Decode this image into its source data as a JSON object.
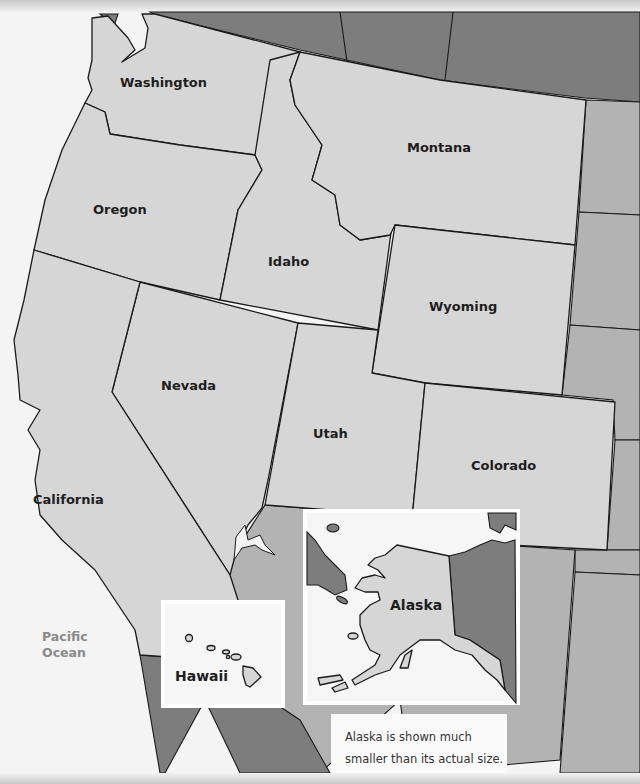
{
  "map": {
    "title": "Western United States",
    "states": [
      {
        "id": "washington",
        "label": "Washington"
      },
      {
        "id": "oregon",
        "label": "Oregon"
      },
      {
        "id": "california",
        "label": "California"
      },
      {
        "id": "idaho",
        "label": "Idaho"
      },
      {
        "id": "nevada",
        "label": "Nevada"
      },
      {
        "id": "montana",
        "label": "Montana"
      },
      {
        "id": "wyoming",
        "label": "Wyoming"
      },
      {
        "id": "utah",
        "label": "Utah"
      },
      {
        "id": "colorado",
        "label": "Colorado"
      }
    ],
    "ocean_label_line1": "Pacific",
    "ocean_label_line2": "Ocean",
    "colors": {
      "state_fill": "#d6d6d6",
      "neighbor_fill": "#b3b3b3",
      "canada_mexico_fill": "#7d7d7d",
      "water": "#f4f4f4",
      "border": "#1a1a1a",
      "ocean_label": "#8a8a8a"
    }
  },
  "insets": {
    "hawaii": {
      "label": "Hawaii"
    },
    "alaska": {
      "label": "Alaska"
    }
  },
  "note": {
    "line1": "Alaska is shown much",
    "line2": "smaller than its actual size."
  }
}
